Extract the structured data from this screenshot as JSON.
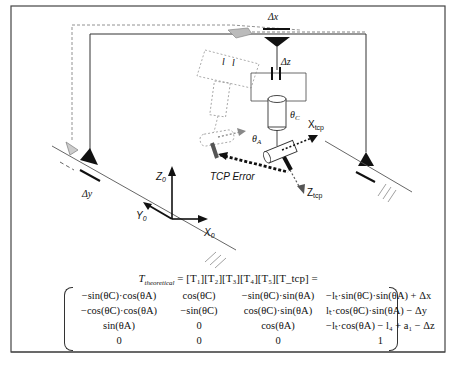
{
  "diagram": {
    "labels": {
      "delta_x": "Δx",
      "delta_y": "Δy",
      "delta_z": "Δz",
      "theta_c": "θ",
      "theta_c_sub": "C",
      "theta_a": "θ",
      "theta_a_sub": "A",
      "x_tcp": "X",
      "x_tcp_sub": "tcp",
      "z_tcp": "Z",
      "z_tcp_sub": "tcp",
      "tcp_error": "TCP Error",
      "z0": "Z",
      "z0_sub": "0",
      "y0": "Y",
      "y0_sub": "0",
      "x0": "X",
      "x0_sub": "0",
      "l_label": "l"
    },
    "equation": {
      "lhs": "T",
      "lhs_sub": "theoretical",
      "rhs": "= [T₁][T₂][T₃][T₄][T₅][T_tcp] =",
      "rows": [
        [
          "−sin(θC)·cos(θA)",
          "cos(θC)",
          "−sin(θC)·sin(θA)",
          "−lₜ·sin(θC)·sin(θA) + Δx"
        ],
        [
          "−cos(θC)·cos(θA)",
          "−sin(θC)",
          "cos(θC)·sin(θA)",
          "lₜ·cos(θC)·sin(θA) − Δy"
        ],
        [
          "sin(θA)",
          "0",
          "cos(θA)",
          "−lₜ·cos(θA) − l₄ + a₁ − Δz"
        ],
        [
          "0",
          "0",
          "0",
          "1"
        ]
      ]
    }
  }
}
